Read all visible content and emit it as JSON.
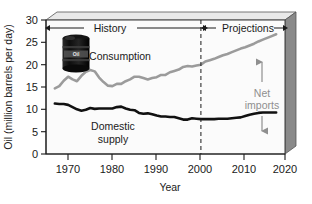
{
  "chart_data": {
    "type": "line",
    "title": "",
    "xlabel": "Year",
    "ylabel": "Oil (million barrels per day)",
    "xlim": [
      1968,
      2022
    ],
    "ylim": [
      0,
      30
    ],
    "xticks": [
      1970,
      1980,
      1990,
      2000,
      2010,
      2020
    ],
    "yticks": [
      0,
      5,
      10,
      15,
      20,
      25,
      30
    ],
    "grid": false,
    "legend": "inline-labels",
    "series": [
      {
        "name": "Consumption",
        "color": "#9b9b9b",
        "x": [
          1970,
          1971,
          1972,
          1973,
          1974,
          1975,
          1976,
          1977,
          1978,
          1979,
          1980,
          1981,
          1982,
          1983,
          1984,
          1985,
          1986,
          1987,
          1988,
          1989,
          1990,
          1991,
          1992,
          1993,
          1994,
          1995,
          1996,
          1997,
          1998,
          1999,
          2000,
          2001,
          2002,
          2003,
          2004,
          2005,
          2006,
          2007,
          2008,
          2009,
          2010,
          2011,
          2012,
          2013,
          2014,
          2015,
          2016,
          2017,
          2018,
          2019,
          2020
        ],
        "values": [
          14.7,
          15.2,
          16.4,
          17.3,
          16.7,
          16.3,
          17.5,
          18.4,
          18.8,
          18.5,
          17.1,
          16.1,
          15.3,
          15.2,
          15.7,
          15.7,
          16.3,
          16.7,
          17.3,
          17.3,
          17.0,
          16.7,
          17.0,
          17.2,
          17.7,
          17.7,
          18.3,
          18.6,
          18.9,
          19.5,
          19.7,
          19.6,
          19.8,
          20.0,
          20.7,
          21.0,
          21.3,
          21.7,
          22.1,
          22.4,
          22.8,
          23.2,
          23.6,
          23.9,
          24.3,
          24.7,
          25.2,
          25.6,
          26.0,
          26.4,
          26.8
        ]
      },
      {
        "name": "Domestic supply",
        "color": "#111111",
        "x": [
          1970,
          1971,
          1972,
          1973,
          1974,
          1975,
          1976,
          1977,
          1978,
          1979,
          1980,
          1981,
          1982,
          1983,
          1984,
          1985,
          1986,
          1987,
          1988,
          1989,
          1990,
          1991,
          1992,
          1993,
          1994,
          1995,
          1996,
          1997,
          1998,
          1999,
          2000,
          2001,
          2002,
          2003,
          2004,
          2005,
          2006,
          2007,
          2008,
          2009,
          2010,
          2011,
          2012,
          2013,
          2014,
          2015,
          2016,
          2017,
          2018,
          2019,
          2020
        ],
        "values": [
          11.3,
          11.2,
          11.2,
          11.0,
          10.5,
          10.0,
          9.7,
          9.9,
          10.3,
          10.1,
          10.2,
          10.2,
          10.2,
          10.2,
          10.5,
          10.6,
          10.2,
          9.9,
          9.8,
          9.2,
          9.0,
          9.1,
          8.9,
          8.6,
          8.4,
          8.4,
          8.3,
          8.3,
          8.0,
          7.7,
          7.7,
          8.0,
          7.9,
          7.8,
          7.8,
          7.8,
          7.8,
          7.9,
          7.9,
          7.9,
          8.0,
          8.1,
          8.2,
          8.5,
          8.8,
          9.0,
          9.2,
          9.3,
          9.3,
          9.3,
          9.3
        ]
      }
    ],
    "annotations": {
      "history_label": "History",
      "projections_label": "Projections",
      "divider_year": 2003,
      "consumption_label": "Consumption",
      "domestic_supply_label": "Domestic supply",
      "domestic_supply_label_line1": "Domestic",
      "domestic_supply_label_line2": "supply",
      "net_imports_label": "Net",
      "net_imports_label_line2": "imports",
      "drum_label": "Oil"
    }
  },
  "colors": {
    "plot_background": "#f0f0f0",
    "plot_face": "#fbfbfb",
    "frame": "#3a3a3a",
    "side_panel": "#8a8a8a",
    "top_panel": "#e4e4e4",
    "consumption": "#9b9b9b",
    "domestic": "#111111",
    "text": "#1a1a1a",
    "net_imports_text": "#8f8f8f"
  },
  "axes": {
    "y_title": "Oil (million barrels per day)",
    "x_title": "Year",
    "y_tick_0": "0",
    "y_tick_1": "5",
    "y_tick_2": "10",
    "y_tick_3": "15",
    "y_tick_4": "20",
    "y_tick_5": "25",
    "y_tick_6": "30",
    "x_tick_0": "1970",
    "x_tick_1": "1980",
    "x_tick_2": "1990",
    "x_tick_3": "2000",
    "x_tick_4": "2010",
    "x_tick_5": "2020"
  }
}
